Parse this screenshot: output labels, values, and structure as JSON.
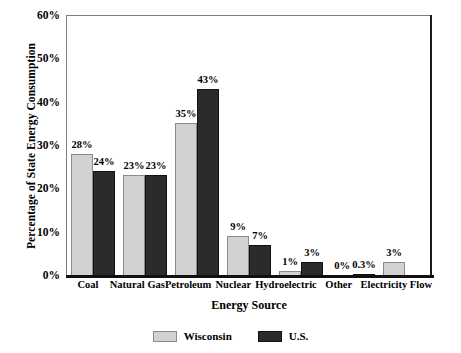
{
  "chart_data": {
    "type": "bar",
    "title": "",
    "xlabel": "Energy Source",
    "ylabel": "Percentage of State Energy Consumption",
    "ylim": [
      0,
      60
    ],
    "yticks": [
      "0%",
      "10%",
      "20%",
      "30%",
      "40%",
      "50%",
      "60%"
    ],
    "ytick_values": [
      0,
      10,
      20,
      30,
      40,
      50,
      60
    ],
    "grid": false,
    "legend_position": "bottom-center",
    "categories": [
      "Coal",
      "Natural Gas",
      "Petroleum",
      "Nuclear",
      "Hydroelectric",
      "Other",
      "Electricity Flow"
    ],
    "series": [
      {
        "name": "Wisconsin",
        "color": "#d2d2d2",
        "values": [
          28,
          23,
          35,
          9,
          1,
          0,
          3
        ],
        "labels": [
          "28%",
          "23%",
          "35%",
          "9%",
          "1%",
          "0%",
          "3%"
        ]
      },
      {
        "name": "U.S.",
        "color": "#2b2b2b",
        "values": [
          24,
          23,
          43,
          7,
          3,
          0.3,
          null
        ],
        "labels": [
          "24%",
          "23%",
          "43%",
          "7%",
          "3%",
          "0.3%",
          ""
        ]
      }
    ]
  },
  "legend": {
    "items": [
      {
        "label": "Wisconsin",
        "color": "#d2d2d2"
      },
      {
        "label": "U.S.",
        "color": "#2b2b2b"
      }
    ]
  }
}
